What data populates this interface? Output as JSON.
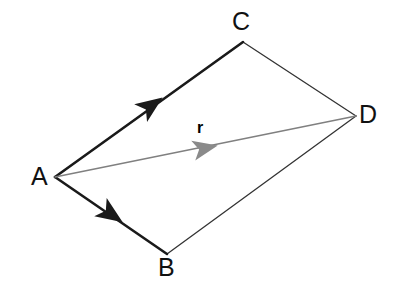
{
  "figure": {
    "background_color": "#ffffff",
    "width": 400,
    "height": 286,
    "edge_color": "#1a1a1a",
    "resultant_color": "#808080"
  },
  "labels": {
    "A": "A",
    "B": "B",
    "C": "C",
    "D": "D",
    "r": "r"
  },
  "chart_data": {
    "type": "diagram",
    "vertices": [
      {
        "name": "A",
        "x": 55,
        "y": 177,
        "label": "A",
        "label_x": 31,
        "label_y": 164
      },
      {
        "name": "B",
        "x": 167,
        "y": 254,
        "label": "B",
        "label_x": 158,
        "label_y": 255
      },
      {
        "name": "C",
        "x": 243,
        "y": 42,
        "label": "C",
        "label_x": 232,
        "label_y": 9
      },
      {
        "name": "D",
        "x": 356,
        "y": 116,
        "label": "D",
        "label_x": 359,
        "label_y": 102
      }
    ],
    "edges": [
      {
        "from": "A",
        "to": "C",
        "style": "vector",
        "arrow": true,
        "color": "#1a1a1a",
        "width": 2.6
      },
      {
        "from": "A",
        "to": "B",
        "style": "vector",
        "arrow": true,
        "color": "#1a1a1a",
        "width": 2.6
      },
      {
        "from": "C",
        "to": "D",
        "style": "line",
        "arrow": false,
        "color": "#333333",
        "width": 1.3
      },
      {
        "from": "B",
        "to": "D",
        "style": "line",
        "arrow": false,
        "color": "#333333",
        "width": 1.3
      },
      {
        "from": "A",
        "to": "D",
        "style": "resultant",
        "arrow": true,
        "color": "#808080",
        "width": 1.5,
        "label": "r"
      }
    ],
    "arrowheads": [
      {
        "on": "A-C",
        "x": 152,
        "y": 105,
        "angle": -34.5
      },
      {
        "on": "A-B",
        "x": 112,
        "y": 215,
        "angle": 34.5
      },
      {
        "on": "A-D",
        "x": 206,
        "y": 147,
        "angle": -11.9
      }
    ]
  }
}
